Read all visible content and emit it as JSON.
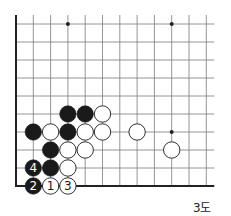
{
  "diagram": {
    "caption": "3도",
    "board": {
      "columns": 12,
      "rows": 10,
      "origin_x": 16,
      "origin_y": 24,
      "spacing_x": 17.3,
      "spacing_y": 18,
      "top_overhang": 9,
      "right_overhang": 8,
      "edges": [
        "left",
        "bottom"
      ],
      "line_color": "#7a7a7a",
      "edge_color": "#222222"
    },
    "star_points": [
      {
        "col": 3,
        "row": 0
      },
      {
        "col": 9,
        "row": 0
      },
      {
        "col": 9,
        "row": 6
      }
    ],
    "stones": [
      {
        "col": 3,
        "row": 5,
        "color": "black"
      },
      {
        "col": 4,
        "row": 5,
        "color": "black"
      },
      {
        "col": 5,
        "row": 5,
        "color": "white"
      },
      {
        "col": 1,
        "row": 6,
        "color": "black"
      },
      {
        "col": 2,
        "row": 6,
        "color": "white"
      },
      {
        "col": 3,
        "row": 6,
        "color": "black"
      },
      {
        "col": 4,
        "row": 6,
        "color": "white"
      },
      {
        "col": 5,
        "row": 6,
        "color": "white"
      },
      {
        "col": 7,
        "row": 6,
        "color": "white"
      },
      {
        "col": 2,
        "row": 7,
        "color": "black"
      },
      {
        "col": 3,
        "row": 7,
        "color": "white"
      },
      {
        "col": 4,
        "row": 7,
        "color": "white"
      },
      {
        "col": 9,
        "row": 7,
        "color": "white"
      },
      {
        "col": 1,
        "row": 8,
        "color": "black",
        "label": "4"
      },
      {
        "col": 2,
        "row": 8,
        "color": "black"
      },
      {
        "col": 3,
        "row": 8,
        "color": "white"
      },
      {
        "col": 1,
        "row": 9,
        "color": "black",
        "label": "2"
      },
      {
        "col": 2,
        "row": 9,
        "color": "white",
        "label": "1"
      },
      {
        "col": 3,
        "row": 9,
        "color": "white",
        "label": "3"
      }
    ]
  }
}
